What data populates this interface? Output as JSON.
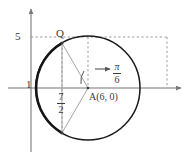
{
  "figure": {
    "type": "coordinate-plane-circle",
    "background_color": "#ffffff",
    "stroke_color": "#1a1a1a",
    "axis_color": "#777777",
    "guide_color": "#9a9a9a",
    "text_color": "#3a3a3a",
    "axes": {
      "x_axis_name": "x-axis",
      "y_axis_name": "y-axis",
      "origin_px": [
        31,
        88
      ]
    },
    "labels": {
      "y_tick_5": "5",
      "x_tick_1": "1",
      "point_q": "Q",
      "point_a": "A(6, 0)",
      "chord_numerator": "7",
      "chord_denominator": "2",
      "angle_numerator": "π",
      "angle_denominator": "6"
    },
    "geometry": {
      "circle_center_px": [
        88,
        88
      ],
      "circle_radius_px": 52,
      "point_q_px": [
        62,
        43
      ],
      "point_bottom_px": [
        62,
        133
      ],
      "bold_arc_description": "major arc on the left from Q down to lower intersection",
      "dashed_guides": [
        "horizontal from y-axis at y=5 to x=167",
        "vertical at circle-center x=88 from y=37 to axis",
        "vertical at x=167 from y=37 to axis",
        "vertical at x=62 from Q down through axis to bottom point"
      ],
      "angle_arc_label": "π/6 measured at center A from positive x direction"
    }
  }
}
